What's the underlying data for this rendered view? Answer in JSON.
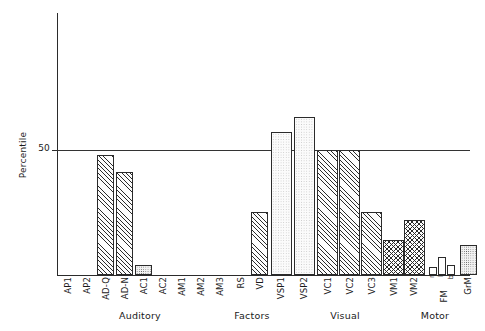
{
  "chart_data": {
    "type": "bar",
    "title": "",
    "xlabel": "",
    "ylabel": "Percentile",
    "ylim": [
      0,
      75
    ],
    "yticks": [
      50
    ],
    "ytick_labels": [
      "50"
    ],
    "grid": "single horizontal reference line at 50",
    "legend": "none",
    "orientation": "vertical",
    "categories": [
      "AP1",
      "AP2",
      "AD-Q",
      "AD-N",
      "AC1",
      "AC2",
      "AM1",
      "AM2",
      "AM3",
      "RS",
      "VD",
      "VSP1",
      "VSP2",
      "VC1",
      "VC2",
      "VC3",
      "VM1",
      "VM2",
      "r",
      "l",
      "b",
      "GrM"
    ],
    "values": [
      0,
      0,
      48,
      41,
      4,
      0,
      0,
      0,
      0,
      0,
      25,
      57,
      63,
      50,
      50,
      25,
      14,
      22,
      3,
      7,
      4,
      12
    ],
    "fills": [
      "none",
      "none",
      "hatch",
      "hatch",
      "stipple",
      "none",
      "none",
      "none",
      "none",
      "none",
      "hatch",
      "light",
      "light",
      "hatch",
      "hatch",
      "hatch",
      "cross",
      "cross",
      "open",
      "open",
      "open",
      "stipple"
    ],
    "groups": [
      {
        "label": "Auditory",
        "members": [
          "AP1",
          "AP2",
          "AD-Q",
          "AD-N",
          "AC1",
          "AC2",
          "AM1",
          "AM2",
          "AM3"
        ]
      },
      {
        "label": "Factors",
        "members": [
          "RS",
          "VD",
          "VSP1",
          "VSP2"
        ]
      },
      {
        "label": "Visual",
        "members": [
          "VC1",
          "VC2",
          "VC3",
          "VM1",
          "VM2"
        ]
      },
      {
        "label": "Motor",
        "members": [
          "FM (r, l, b)",
          "GrM"
        ]
      }
    ],
    "sub_axis_labels": [
      {
        "label": "FM",
        "covers": [
          "r",
          "l",
          "b"
        ]
      }
    ]
  },
  "axis": {
    "y_title": "Percentile",
    "y_tick_50": "50"
  },
  "ticks": {
    "t0": "AP1",
    "t1": "AP2",
    "t2": "AD-Q",
    "t3": "AD-N",
    "t4": "AC1",
    "t5": "AC2",
    "t6": "AM1",
    "t7": "AM2",
    "t8": "AM3",
    "t9": "RS",
    "t10": "VD",
    "t11": "VSP1",
    "t12": "VSP2",
    "t13": "VC1",
    "t14": "VC2",
    "t15": "VC3",
    "t16": "VM1",
    "t17": "VM2",
    "t18": "r",
    "t19": "l",
    "t20": "b",
    "t21": "GrM",
    "fm": "FM"
  },
  "groups": {
    "g0": "Auditory",
    "g1": "Factors",
    "g2": "Visual",
    "g3": "Motor"
  }
}
